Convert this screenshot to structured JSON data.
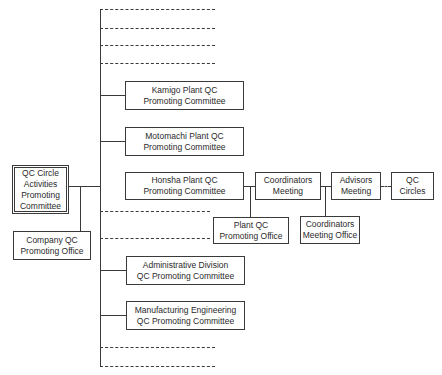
{
  "chart": {
    "type": "org_chart",
    "root": {
      "label": "QC Circle\nActivities\nPromoting\nCommittee"
    },
    "staff": {
      "label": "Company QC\nPromoting Office"
    },
    "committees": [
      {
        "label": "Kamigo Plant QC\nPromoting Committee"
      },
      {
        "label": "Motomachi Plant QC\nPromoting Committee"
      },
      {
        "label": "Honsha Plant QC\nPromoting Committee"
      },
      {
        "label": "Administrative Division\nQC Promoting Committee"
      },
      {
        "label": "Manufacturing Engineering\nQC Promoting Committee"
      }
    ],
    "honsha_chain": [
      {
        "label": "Coordinators\nMeeting"
      },
      {
        "label": "Advisors\nMeeting"
      },
      {
        "label": "QC\nCircles"
      }
    ],
    "honsha_offices": [
      {
        "label": "Plant QC\nPromoting Office"
      },
      {
        "label": "Coordinators\nMeeting Office"
      }
    ]
  }
}
